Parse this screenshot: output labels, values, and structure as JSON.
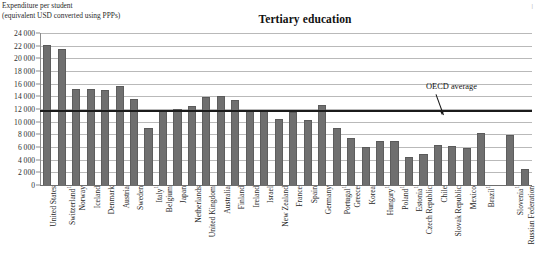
{
  "header": {
    "axis_caption": "Expenditure per student\n(equivalent USD converted using PPPs)",
    "title": "Tertiary education",
    "corner_mark": "|"
  },
  "annotation": {
    "oecd_average_label": "OECD average"
  },
  "chart_data": {
    "type": "bar",
    "title": "Tertiary education",
    "subtitle": "Expenditure per student (equivalent USD converted using PPPs)",
    "xlabel": "",
    "ylabel": "Expenditure per student (equivalent USD converted using PPPs)",
    "ylim": [
      0,
      24000
    ],
    "ytick_step": 2000,
    "ytick_labels": [
      "0",
      "2 000",
      "4 000",
      "6 000",
      "8 000",
      "10 000",
      "12 000",
      "14 000",
      "16 000",
      "18 000",
      "20 000",
      "22 000",
      "24 000"
    ],
    "ytick_values": [
      0,
      2000,
      4000,
      6000,
      8000,
      10000,
      12000,
      14000,
      16000,
      18000,
      20000,
      22000,
      24000
    ],
    "grid": true,
    "legend": "none",
    "bar_color": "#6f6f6f",
    "reference_line": {
      "label": "OECD average",
      "value": 11700,
      "color": "#1b1b1b"
    },
    "categories": [
      "United States",
      "Switzerland¹",
      "Norway",
      "Iceland",
      "Denmark",
      "Austria",
      "Sweden",
      "Italy¹",
      "Belgium",
      "Japan",
      "Netherlands",
      "United Kingdom",
      "Australia",
      "Finland",
      "Ireland",
      "Israel",
      "New Zealand",
      "France",
      "Spain",
      "Germany",
      "Portugal¹",
      "Greece",
      "Korea",
      "Hungary¹",
      "Poland¹",
      "Estonia¹",
      "Czech Republic",
      "Chile",
      "Slovak Republic",
      "Mexico",
      "Brazil¹",
      "",
      "Slovenia¹",
      "Russian Federation"
    ],
    "values": [
      22100,
      21400,
      15200,
      15200,
      15000,
      15700,
      13600,
      9000,
      11900,
      12000,
      12500,
      13900,
      14000,
      13400,
      11900,
      11900,
      10400,
      11600,
      10300,
      12600,
      9000,
      7400,
      6000,
      7000,
      6900,
      4500,
      4900,
      6300,
      6100,
      5800,
      8200,
      null,
      7900,
      2500
    ],
    "footnote": ""
  }
}
